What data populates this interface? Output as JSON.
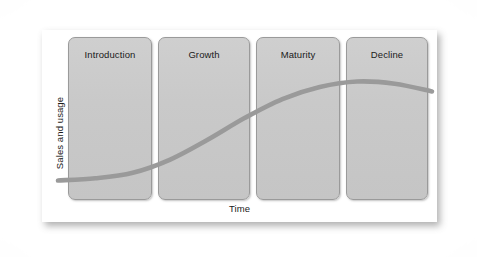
{
  "figure": {
    "kind": "product-life-cycle-diagram",
    "axes": {
      "y_label": "Sales and usage",
      "x_label": "Time"
    },
    "stages": [
      {
        "label": "Introduction"
      },
      {
        "label": "Growth"
      },
      {
        "label": "Maturity"
      },
      {
        "label": "Decline"
      }
    ]
  },
  "chart_data": {
    "type": "line",
    "title": "",
    "xlabel": "Time",
    "ylabel": "Sales and usage",
    "grid": false,
    "legend": null,
    "categories": [
      "Introduction",
      "Growth",
      "Maturity",
      "Decline"
    ],
    "annotations": [
      "Introduction",
      "Growth",
      "Maturity",
      "Decline"
    ],
    "series": [
      {
        "name": "Sales and usage",
        "color": "#9a9a9a",
        "x": [
          0,
          10,
          20,
          30,
          40,
          50,
          60,
          70,
          80,
          90,
          100
        ],
        "values": [
          5,
          7,
          12,
          24,
          42,
          62,
          79,
          90,
          95,
          93,
          86
        ]
      }
    ],
    "xlim": [
      0,
      100
    ],
    "ylim": [
      0,
      100
    ]
  },
  "colors": {
    "box_fill": "#c9c9c9",
    "box_border": "#9a9a9a",
    "curve": "#9a9a9a",
    "card_background": "#ffffff",
    "text": "#1a1a1a"
  }
}
